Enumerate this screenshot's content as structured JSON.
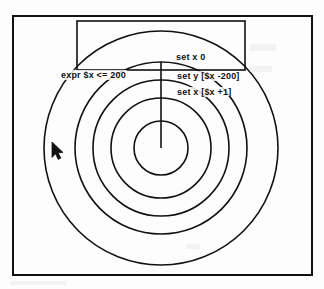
{
  "app": {
    "title": "Tk Canvas Demo",
    "background_color": "#fdfdfd",
    "ink_color": "#111111"
  },
  "frame": {
    "name": "outer-frame",
    "x": 13,
    "y": 16,
    "width": 299,
    "height": 259,
    "stroke": "#111111",
    "stroke_width": 2
  },
  "inner_rect": {
    "name": "inner-rectangle",
    "x": 77,
    "y": 21,
    "width": 168,
    "height": 49,
    "stroke": "#111111",
    "stroke_width": 1.6
  },
  "circles": {
    "center_x": 161,
    "center_y": 148,
    "stroke": "#111111",
    "stroke_width": 1.6,
    "radii": [
      27,
      50,
      68,
      86,
      117
    ],
    "count": 5
  },
  "radius_line": {
    "name": "radius-line",
    "x1": 161,
    "y1": 148,
    "x2": 161,
    "y2": 62,
    "stroke": "#111111",
    "stroke_width": 1.6
  },
  "labels": [
    {
      "id": "label-expr",
      "text": "expr $x <= 200",
      "x": 60,
      "y": 70
    },
    {
      "id": "label-setx0",
      "text": "set x 0",
      "x": 175,
      "y": 52
    },
    {
      "id": "label-sety",
      "text": "set y [$x -200]",
      "x": 176,
      "y": 71
    },
    {
      "id": "label-setx1",
      "text": "set x [$x +1]",
      "x": 176,
      "y": 87
    }
  ],
  "cursor": {
    "name": "mouse-pointer",
    "x": 51,
    "y": 141,
    "fill": "#111111"
  }
}
